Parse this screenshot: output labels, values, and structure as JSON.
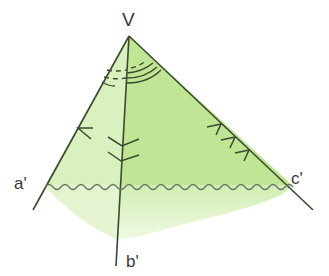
{
  "diagram": {
    "vertex_label": "V",
    "edge_labels": {
      "a": "a'",
      "b": "b'",
      "c": "c'"
    },
    "colors": {
      "face_left": "#d7efbb",
      "face_right": "#b8e38c",
      "fade": "#c6ea9e",
      "line": "#3a4a30",
      "wave": "#6a7a66"
    },
    "angle_arcs": {
      "face_ab": 2,
      "face_bc": 3,
      "face_ac": 3
    },
    "edge_marks": {
      "a": 1,
      "b": 2,
      "c": 3
    }
  }
}
